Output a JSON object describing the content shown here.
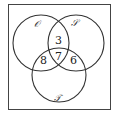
{
  "diagram": {
    "type": "venn",
    "sets": [
      {
        "name": "O",
        "label": "𝒪"
      },
      {
        "name": "S",
        "label": "𝒮"
      },
      {
        "name": "T",
        "label": "𝒯"
      }
    ],
    "regions": {
      "O_and_S_only": "3",
      "O_and_T_only": "8",
      "O_and_S_and_T": "7",
      "S_and_T_only": "6"
    },
    "colors": {
      "stroke": "#333333",
      "background": "#ffffff"
    }
  }
}
